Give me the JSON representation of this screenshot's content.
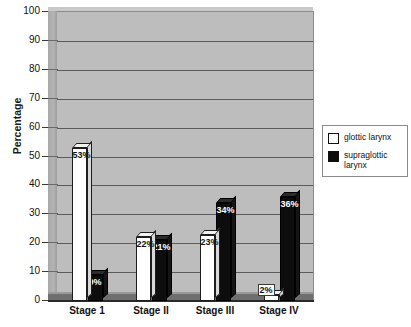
{
  "chart_data": {
    "type": "bar",
    "title": "",
    "subtitle": "",
    "xlabel": "",
    "ylabel": "Percentage",
    "ylim": [
      0,
      100
    ],
    "ytick_step": 10,
    "yticks": [
      100,
      90,
      80,
      70,
      60,
      50,
      40,
      30,
      20,
      10,
      0
    ],
    "grid": true,
    "grid_orientation": "horizontal",
    "legend_position": "right",
    "style": "3d-grouped-bar",
    "categories": [
      "Stage 1",
      "Stage II",
      "Stage III",
      "Stage IV"
    ],
    "series": [
      {
        "name": "glottic larynx",
        "color": "#ffffff",
        "values": [
          53,
          22,
          23,
          2
        ],
        "labels": [
          "53%",
          "22%",
          "23%",
          "2%"
        ]
      },
      {
        "name": "supraglottic larynx",
        "color": "#0d0d0d",
        "values": [
          9,
          21,
          34,
          36
        ],
        "labels": [
          "9%",
          "21%",
          "34%",
          "36%"
        ]
      }
    ]
  },
  "legend": {
    "entries": [
      {
        "label": "glottic larynx",
        "swatch": "white"
      },
      {
        "label": "supraglottic larynx",
        "swatch": "black"
      }
    ]
  }
}
